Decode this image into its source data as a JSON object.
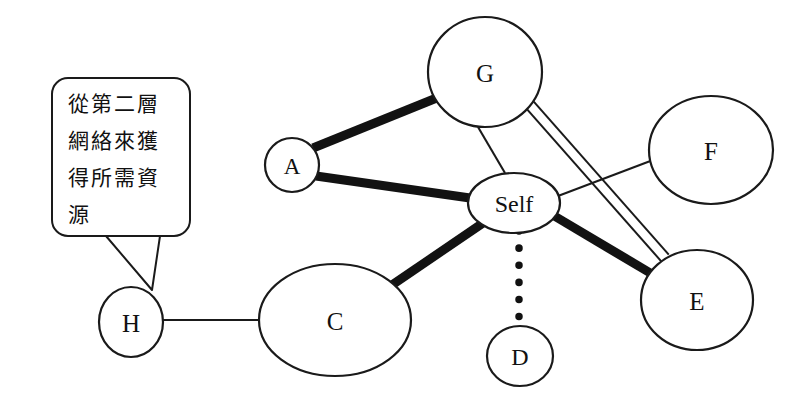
{
  "diagram": {
    "background_color": "#ffffff",
    "line_color": "#1a1a1a",
    "canvas": {
      "width": 798,
      "height": 409
    },
    "nodes": [
      {
        "id": "G",
        "label": "G",
        "cx": 485,
        "cy": 72,
        "rx": 57,
        "ry": 55,
        "font_size": 25
      },
      {
        "id": "A",
        "label": "A",
        "cx": 292,
        "cy": 165,
        "rx": 27,
        "ry": 27,
        "font_size": 23
      },
      {
        "id": "Self",
        "label": "Self",
        "cx": 514,
        "cy": 203,
        "rx": 46,
        "ry": 30,
        "font_size": 24
      },
      {
        "id": "F",
        "label": "F",
        "cx": 711,
        "cy": 150,
        "rx": 62,
        "ry": 54,
        "font_size": 25
      },
      {
        "id": "E",
        "label": "E",
        "cx": 697,
        "cy": 300,
        "rx": 56,
        "ry": 50,
        "font_size": 25
      },
      {
        "id": "C",
        "label": "C",
        "cx": 335,
        "cy": 320,
        "rx": 76,
        "ry": 56,
        "font_size": 25
      },
      {
        "id": "H",
        "label": "H",
        "cx": 131,
        "cy": 322,
        "rx": 32,
        "ry": 35,
        "font_size": 25
      },
      {
        "id": "D",
        "label": "D",
        "cx": 520,
        "cy": 356,
        "rx": 33,
        "ry": 30,
        "font_size": 24
      }
    ],
    "edges": [
      {
        "from": "A",
        "to": "G",
        "style": "thick",
        "x1": 313,
        "y1": 148,
        "x2": 444,
        "y2": 95
      },
      {
        "from": "A",
        "to": "Self",
        "style": "thick",
        "x1": 316,
        "y1": 176,
        "x2": 470,
        "y2": 198
      },
      {
        "from": "C",
        "to": "Self",
        "style": "thick",
        "x1": 392,
        "y1": 285,
        "x2": 483,
        "y2": 223
      },
      {
        "from": "Self",
        "to": "E",
        "style": "thick",
        "x1": 551,
        "y1": 214,
        "x2": 657,
        "y2": 277
      },
      {
        "from": "G",
        "to": "Self",
        "style": "thin",
        "x1": 478,
        "y1": 127,
        "x2": 505,
        "y2": 173
      },
      {
        "from": "Self",
        "to": "F",
        "style": "thin",
        "x1": 558,
        "y1": 196,
        "x2": 653,
        "y2": 160
      },
      {
        "from": "H",
        "to": "C",
        "style": "thin",
        "x1": 163,
        "y1": 320,
        "x2": 259,
        "y2": 320
      },
      {
        "from": "G",
        "to": "E",
        "style": "double",
        "x1": 530,
        "y1": 105,
        "x2": 665,
        "y2": 258,
        "offset": 5
      },
      {
        "from": "Self",
        "to": "D",
        "style": "dotted",
        "x1": 519,
        "y1": 231,
        "x2": 519,
        "y2": 324
      }
    ],
    "callout": {
      "id": "speech-bubble",
      "lines": [
        "從第二層",
        "網絡來獲",
        "得所需資",
        "源"
      ],
      "box": {
        "x": 52,
        "y": 78,
        "width": 138,
        "height": 158,
        "radius": 16
      },
      "tail_points": "106,236 152,290 160,236",
      "points_to": "H"
    }
  }
}
